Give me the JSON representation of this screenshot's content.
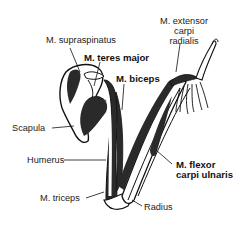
{
  "figure": {
    "labels": [
      {
        "id": "supraspinatus",
        "text": "M. supraspinatus",
        "bold": false
      },
      {
        "id": "teres_major",
        "text": "M. teres major",
        "bold": true
      },
      {
        "id": "biceps",
        "text": "M. biceps",
        "bold": true
      },
      {
        "id": "extensor_carpi_radialis",
        "lines": [
          "M. extensor",
          "carpi",
          "radialis"
        ],
        "bold": false
      },
      {
        "id": "scapula",
        "text": "Scapula",
        "bold": false
      },
      {
        "id": "humerus",
        "text": "Humerus",
        "bold": false
      },
      {
        "id": "flexor_carpi_ulnaris",
        "lines": [
          "M. flexor",
          "carpi ulnaris"
        ],
        "bold": true
      },
      {
        "id": "triceps",
        "text": "M. triceps",
        "bold": false
      },
      {
        "id": "radius",
        "text": "Radius",
        "bold": false
      }
    ]
  },
  "colors": {
    "muscle": "#2a2a2a",
    "outline": "#111111",
    "bone": "#ffffff",
    "text": "#222222"
  }
}
